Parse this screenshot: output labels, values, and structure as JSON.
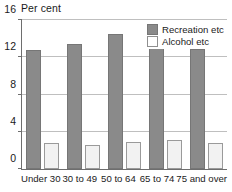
{
  "chart_data": {
    "type": "bar",
    "title": "Per cent",
    "xlabel": "",
    "ylabel": "",
    "ylim": [
      0,
      16
    ],
    "yticks": [
      0,
      4,
      8,
      12,
      16
    ],
    "grid": true,
    "legend_position": "top-right-inside",
    "categories": [
      "Under 30",
      "30 to 49",
      "50 to 64",
      "65 to 74",
      "75 and over"
    ],
    "series": [
      {
        "name": "Recreation etc",
        "color": "#8a8a8a",
        "values": [
          12.8,
          13.4,
          14.5,
          15.5,
          12.9
        ]
      },
      {
        "name": "Alcohol etc",
        "color": "#f2f2f2",
        "values": [
          2.8,
          2.6,
          2.9,
          3.1,
          2.8
        ]
      }
    ]
  }
}
